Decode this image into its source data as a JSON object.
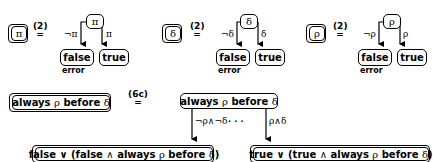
{
  "rules": [
    {
      "lhs_symbol": "π",
      "equation_label": "(2)",
      "root_symbol": "π",
      "left_edge_label": "¬π",
      "right_edge_label": "π",
      "left_node": "false",
      "right_node": "true",
      "left_annotation": "error"
    },
    {
      "lhs_symbol": "δ",
      "equation_label": "(2)",
      "root_symbol": "δ",
      "left_edge_label": "¬δ",
      "right_edge_label": "δ",
      "left_node": "false",
      "right_node": "true",
      "left_annotation": "error"
    },
    {
      "lhs_symbol": "ρ",
      "equation_label": "(2)",
      "root_symbol": "ρ",
      "left_edge_label": "¬ρ",
      "right_edge_label": "ρ",
      "left_node": "false",
      "right_node": "true",
      "left_annotation": "error"
    }
  ],
  "bottom_rule": {
    "lhs_pre": "always ",
    "lhs_sym1": "ρ",
    "lhs_mid": " before ",
    "lhs_sym2": "δ",
    "equation_label": "(6c)",
    "root_pre": "always ",
    "root_sym1": "ρ",
    "root_mid": " before ",
    "root_sym2": "δ",
    "left_edge_label": "¬ρ∧¬δ",
    "ellipsis": "· · ·",
    "right_edge_label": "ρ∧δ",
    "left_result_a": "false ∨ (false ",
    "left_result_and": "∧",
    "left_result_b": " always ",
    "left_result_sym1": "ρ",
    "left_result_c": " before ",
    "left_result_sym2": "δ",
    "left_result_d": ")",
    "right_result_a": "true ∨ (true ",
    "right_result_and": "∧",
    "right_result_b": " always ",
    "right_result_sym1": "ρ",
    "right_result_c": " before ",
    "right_result_sym2": "δ",
    "right_result_d": ")"
  }
}
